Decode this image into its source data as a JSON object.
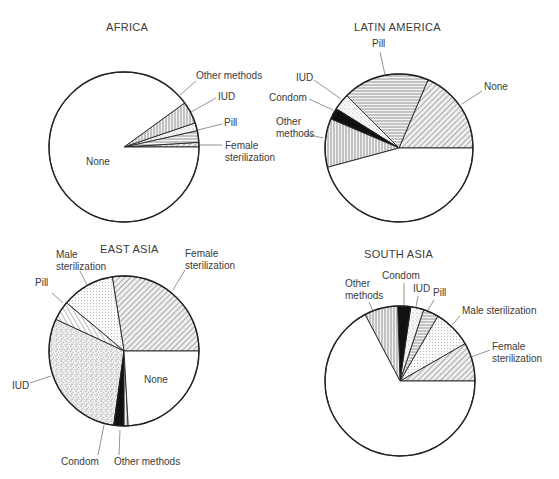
{
  "chart_data": [
    {
      "type": "pie",
      "title": "AFRICA",
      "center": [
        124,
        147
      ],
      "radius": 75,
      "start_angle_deg": 0,
      "direction": "counterclockwise",
      "slices": [
        {
          "label": "Female sterilization",
          "value": 1,
          "pattern": "diag"
        },
        {
          "label": "Pill",
          "value": 2.5,
          "pattern": "horiz"
        },
        {
          "label": "IUD",
          "value": 1.7,
          "pattern": "dots"
        },
        {
          "label": "Other methods",
          "value": 4.8,
          "pattern": "vert"
        },
        {
          "label": "None",
          "value": 90,
          "pattern": "white"
        }
      ],
      "labels": [
        {
          "text": [
            "Other methods"
          ],
          "x": 196,
          "y": 79,
          "lx1": 180,
          "ly1": 95,
          "lx2": 196,
          "ly2": 81
        },
        {
          "text": [
            "IUD"
          ],
          "x": 218,
          "y": 100,
          "lx1": 191,
          "ly1": 112,
          "lx2": 216,
          "ly2": 98
        },
        {
          "text": [
            "Pill"
          ],
          "x": 224,
          "y": 126,
          "lx1": 198,
          "ly1": 130,
          "lx2": 222,
          "ly2": 124
        },
        {
          "text": [
            "Female",
            "sterilization"
          ],
          "x": 225,
          "y": 149,
          "lx1": 199,
          "ly1": 145,
          "lx2": 222,
          "ly2": 145
        },
        {
          "text": [
            "None"
          ],
          "x": 86,
          "y": 165
        }
      ],
      "title_pos": [
        106,
        31
      ]
    },
    {
      "type": "pie",
      "title": "LATIN AMERICA",
      "center": [
        399,
        148
      ],
      "radius": 74,
      "start_angle_deg": 0,
      "direction": "counterclockwise",
      "slices": [
        {
          "label": "None (hatched slice as labeled)",
          "value": 18.6,
          "pattern": "diag"
        },
        {
          "label": "Pill",
          "value": 18.9,
          "pattern": "horiz"
        },
        {
          "label": "IUD",
          "value": 3.6,
          "pattern": "dots"
        },
        {
          "label": "Condom",
          "value": 2.5,
          "pattern": "black"
        },
        {
          "label": "Other methods",
          "value": 10.6,
          "pattern": "vert"
        },
        {
          "label": "(unlabeled)",
          "value": 45.8,
          "pattern": "white"
        }
      ],
      "labels": [
        {
          "text": [
            "Pill"
          ],
          "x": 372,
          "y": 47,
          "lx1": 385,
          "ly1": 75,
          "lx2": 380,
          "ly2": 52
        },
        {
          "text": [
            "None"
          ],
          "x": 484,
          "y": 90,
          "lx1": 462,
          "ly1": 104,
          "lx2": 482,
          "ly2": 91
        },
        {
          "text": [
            "IUD"
          ],
          "x": 296,
          "y": 81,
          "lx1": 341,
          "ly1": 99,
          "lx2": 314,
          "ly2": 80
        },
        {
          "text": [
            "Condom"
          ],
          "x": 269,
          "y": 101,
          "lx1": 333,
          "ly1": 110,
          "lx2": 309,
          "ly2": 99
        },
        {
          "text": [
            "Other",
            "methods"
          ],
          "x": 276,
          "y": 125,
          "lx1": 323,
          "ly1": 138,
          "lx2": 306,
          "ly2": 134
        }
      ],
      "title_pos": [
        354,
        31
      ]
    },
    {
      "type": "pie",
      "title": "EAST ASIA",
      "center": [
        124,
        351
      ],
      "radius": 75,
      "start_angle_deg": 0,
      "direction": "counterclockwise",
      "slices": [
        {
          "label": "Female sterilization",
          "value": 27.5,
          "pattern": "diag"
        },
        {
          "label": "Male sterilization",
          "value": 11.4,
          "pattern": "grid"
        },
        {
          "label": "Pill",
          "value": 4.2,
          "pattern": "diagl"
        },
        {
          "label": "IUD",
          "value": 29.7,
          "pattern": "dense"
        },
        {
          "label": "Condom",
          "value": 2.2,
          "pattern": "black"
        },
        {
          "label": "Other methods",
          "value": 0.9,
          "pattern": "vert"
        },
        {
          "label": "None",
          "value": 24.1,
          "pattern": "white"
        }
      ],
      "labels": [
        {
          "text": [
            "Male",
            "sterilization"
          ],
          "x": 56,
          "y": 258,
          "anchor": "start",
          "lx1": 87,
          "ly1": 285,
          "lx2": 80,
          "ly2": 271
        },
        {
          "text": [
            "Female",
            "sterilization"
          ],
          "x": 185,
          "y": 257,
          "lx1": 173,
          "ly1": 290,
          "lx2": 185,
          "ly2": 270
        },
        {
          "text": [
            "Pill"
          ],
          "x": 35,
          "y": 286,
          "lx1": 63,
          "ly1": 303,
          "lx2": 52,
          "ly2": 293
        },
        {
          "text": [
            "IUD"
          ],
          "x": 12,
          "y": 389,
          "lx1": 51,
          "ly1": 376,
          "lx2": 30,
          "ly2": 383
        },
        {
          "text": [
            "Condom"
          ],
          "x": 61,
          "y": 465,
          "lx1": 104,
          "ly1": 425,
          "lx2": 98,
          "ly2": 455
        },
        {
          "text": [
            "Other methods"
          ],
          "x": 114,
          "y": 465,
          "lx1": 120,
          "ly1": 430,
          "lx2": 119,
          "ly2": 455
        },
        {
          "text": [
            "None"
          ],
          "x": 144,
          "y": 383
        }
      ],
      "title_pos": [
        100,
        253
      ]
    },
    {
      "type": "pie",
      "title": "SOUTH ASIA",
      "center": [
        400,
        381
      ],
      "radius": 75,
      "start_angle_deg": 0,
      "direction": "counterclockwise",
      "slices": [
        {
          "label": "Female sterilization",
          "value": 8.3,
          "pattern": "diag"
        },
        {
          "label": "Male sterilization",
          "value": 8.3,
          "pattern": "grid"
        },
        {
          "label": "Pill",
          "value": 3.3,
          "pattern": "horiz"
        },
        {
          "label": "IUD",
          "value": 2.8,
          "pattern": "dots"
        },
        {
          "label": "Condom",
          "value": 2.8,
          "pattern": "black"
        },
        {
          "label": "Other methods",
          "value": 7.2,
          "pattern": "vert"
        },
        {
          "label": "None",
          "value": 67.3,
          "pattern": "white"
        }
      ],
      "labels": [
        {
          "text": [
            "Condom"
          ],
          "x": 382,
          "y": 279,
          "lx1": 404,
          "ly1": 305,
          "lx2": 404,
          "ly2": 283
        },
        {
          "text": [
            "Other",
            "methods"
          ],
          "x": 345,
          "y": 287,
          "lx1": 373,
          "ly1": 311,
          "lx2": 369,
          "ly2": 302
        },
        {
          "text": [
            "IUD"
          ],
          "x": 413,
          "y": 292,
          "lx1": 416,
          "ly1": 307,
          "lx2": 418,
          "ly2": 296
        },
        {
          "text": [
            "Pill"
          ],
          "x": 433,
          "y": 296,
          "lx1": 428,
          "ly1": 310,
          "lx2": 434,
          "ly2": 300
        },
        {
          "text": [
            "Male sterilization"
          ],
          "x": 462,
          "y": 314,
          "anchor": "start",
          "lx1": 452,
          "ly1": 325,
          "lx2": 460,
          "ly2": 316
        },
        {
          "text": [
            "Female",
            "sterilization"
          ],
          "x": 492,
          "y": 350,
          "anchor": "start",
          "lx1": 471,
          "ly1": 357,
          "lx2": 490,
          "ly2": 350
        }
      ],
      "title_pos": [
        364,
        258
      ]
    }
  ],
  "page": {
    "width": 559,
    "height": 479
  }
}
